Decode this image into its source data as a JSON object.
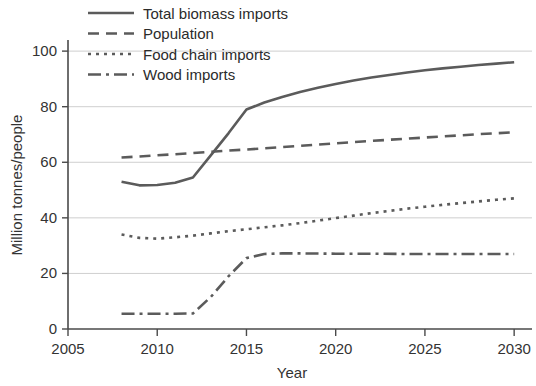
{
  "chart_data": {
    "type": "line",
    "title": "",
    "xlabel": "Year",
    "ylabel": "Million tonnes/people",
    "xlim": [
      2005,
      2031
    ],
    "ylim": [
      0,
      104
    ],
    "xticks": [
      2005,
      2010,
      2015,
      2020,
      2025,
      2030
    ],
    "yticks": [
      0,
      20,
      40,
      60,
      80,
      100
    ],
    "grid": "horizontal",
    "legend_position": "top-left",
    "series": [
      {
        "name": "Total biomass imports",
        "style": "solid",
        "color": "#5b5b5b",
        "x": [
          2008,
          2009,
          2010,
          2011,
          2012,
          2013,
          2014,
          2015,
          2016,
          2017,
          2018,
          2019,
          2020,
          2021,
          2022,
          2023,
          2024,
          2025,
          2026,
          2027,
          2028,
          2029,
          2030
        ],
        "y": [
          53.0,
          51.7,
          51.8,
          52.6,
          54.5,
          62.5,
          70.5,
          79.0,
          81.5,
          83.5,
          85.3,
          86.8,
          88.2,
          89.4,
          90.5,
          91.4,
          92.3,
          93.1,
          93.8,
          94.4,
          95.0,
          95.5,
          96.0
        ]
      },
      {
        "name": "Population",
        "style": "dashed",
        "color": "#5b5b5b",
        "x": [
          2008,
          2010,
          2012,
          2014,
          2016,
          2018,
          2020,
          2022,
          2024,
          2026,
          2028,
          2030
        ],
        "y": [
          61.7,
          62.5,
          63.3,
          64.2,
          65.0,
          65.9,
          66.8,
          67.7,
          68.5,
          69.3,
          70.1,
          70.8
        ]
      },
      {
        "name": "Food chain imports",
        "style": "dotted",
        "color": "#5b5b5b",
        "x": [
          2008,
          2009,
          2010,
          2011,
          2012,
          2013,
          2014,
          2015,
          2016,
          2017,
          2018,
          2019,
          2020,
          2021,
          2022,
          2023,
          2024,
          2025,
          2026,
          2027,
          2028,
          2029,
          2030
        ],
        "y": [
          34.0,
          32.8,
          32.5,
          33.0,
          33.6,
          34.4,
          35.2,
          35.9,
          36.6,
          37.3,
          38.1,
          39.0,
          39.9,
          40.8,
          41.7,
          42.5,
          43.3,
          44.0,
          44.7,
          45.3,
          45.9,
          46.5,
          47.0
        ]
      },
      {
        "name": "Wood imports",
        "style": "dashdot",
        "color": "#5b5b5b",
        "x": [
          2008,
          2009,
          2010,
          2011,
          2012,
          2013,
          2014,
          2015,
          2016,
          2017,
          2018,
          2020,
          2022,
          2024,
          2026,
          2028,
          2030
        ],
        "y": [
          5.5,
          5.5,
          5.5,
          5.5,
          5.6,
          11.5,
          19.0,
          25.5,
          27.0,
          27.2,
          27.2,
          27.1,
          27.1,
          27.0,
          27.0,
          27.0,
          27.0
        ]
      }
    ]
  },
  "axes": {
    "y_title": "Million tonnes/people",
    "x_title": "Year",
    "x_tick_labels": [
      "2005",
      "2010",
      "2015",
      "2020",
      "2025",
      "2030"
    ],
    "y_tick_labels": [
      "0",
      "20",
      "40",
      "60",
      "80",
      "100"
    ]
  },
  "legend": {
    "items": [
      {
        "label": "Total biomass imports",
        "style": "solid"
      },
      {
        "label": "Population",
        "style": "dashed"
      },
      {
        "label": "Food chain imports",
        "style": "dotted"
      },
      {
        "label": "Wood imports",
        "style": "dashdot"
      }
    ]
  },
  "colors": {
    "series": "#5b5b5b",
    "grid": "#cfcfcf",
    "axis": "#4a4a4a",
    "text": "#333333",
    "background": "#ffffff"
  }
}
